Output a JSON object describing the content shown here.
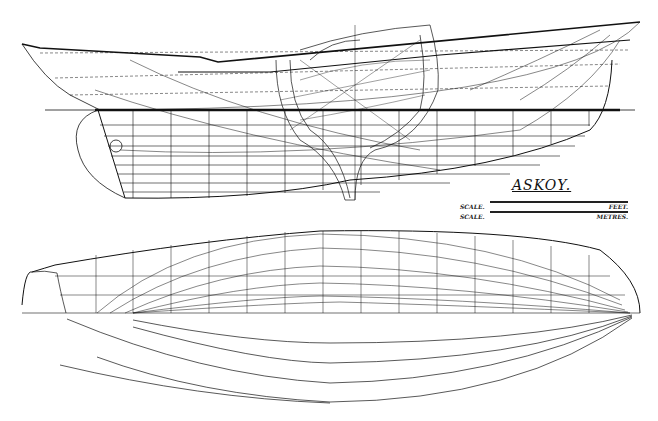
{
  "drawing": {
    "title": "ASKOY.",
    "scales": [
      {
        "left": "SCALE.",
        "right": "FEET."
      },
      {
        "left": "SCALE.",
        "right": "METRES."
      }
    ],
    "views": [
      "sheer-plan",
      "body-plan",
      "half-breadth-plan"
    ],
    "colors": {
      "ink": "#111111",
      "paper": "#ffffff"
    }
  }
}
